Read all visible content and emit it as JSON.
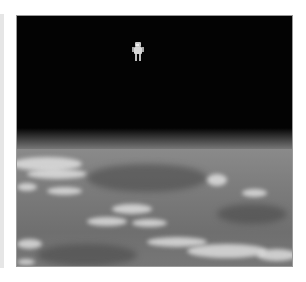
{
  "image": {
    "description": "Astronaut floating untethered in black space above Earth's cloud-covered surface",
    "subject": "astronaut",
    "regions": [
      "space",
      "horizon",
      "earth-clouds"
    ],
    "colors": {
      "space": "#030303",
      "horizon": "#7c7c7c",
      "earth": "#777777",
      "clouds": "#ebebeb",
      "frame_border": "#9a9a9a",
      "left_strip": "#e6e6e6",
      "background": "#ffffff"
    }
  }
}
